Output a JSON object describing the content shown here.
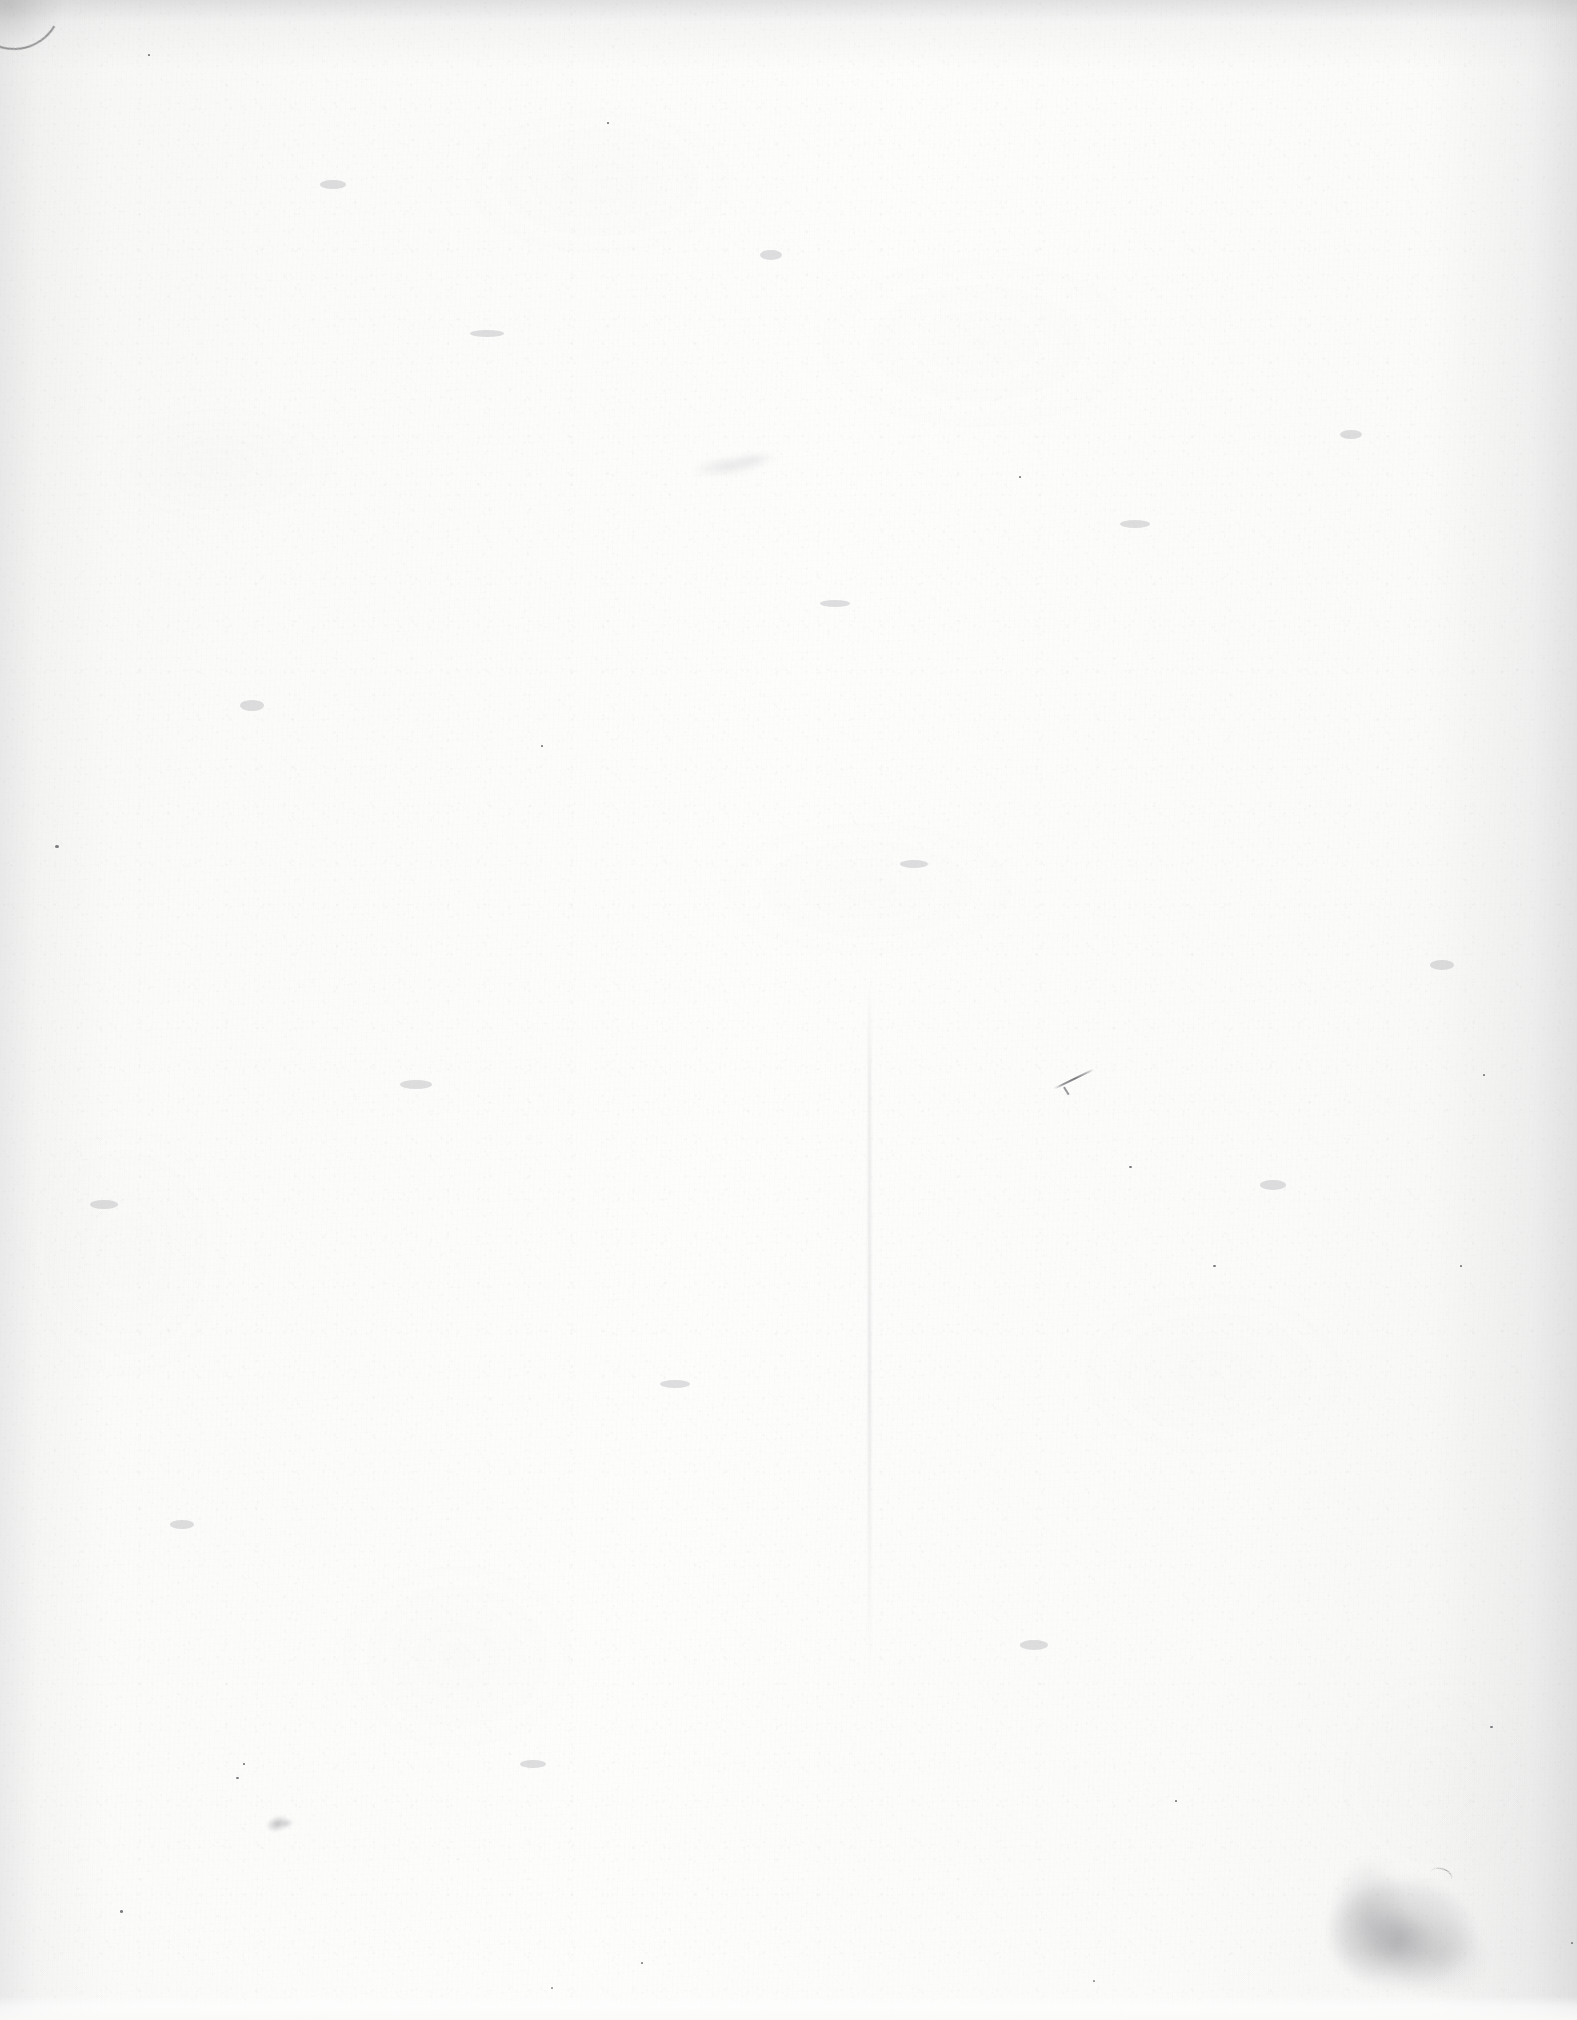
{
  "page": {
    "kind": "scanned-blank-page",
    "width": 1577,
    "height": 2020,
    "text_content": "",
    "orientation": "portrait",
    "background_color": "#fbfbfa",
    "paper_tone": "#f7f7f6",
    "ink_color": "#555559"
  },
  "artifacts": {
    "corner_fold": {
      "name": "torn-corner",
      "position": "top-left",
      "x": 0,
      "y": 0,
      "width": 110,
      "height": 110,
      "color": "#5c5c60"
    },
    "scan_streak": {
      "name": "vertical-scan-streak",
      "x": 868,
      "y": 980,
      "width": 3,
      "height": 700,
      "color": "#a0a0a5"
    },
    "stain": {
      "name": "corner-stain",
      "position": "bottom-right",
      "x": 1300,
      "y": 1855,
      "width": 230,
      "height": 165,
      "color": "#707076"
    },
    "smudge": {
      "name": "graphite-smudge",
      "position": "lower-left",
      "x": 258,
      "y": 1805,
      "width": 46,
      "height": 34,
      "color": "#6e6e74"
    },
    "pen_mark": {
      "name": "diagonal-pen-stroke",
      "x": 1052,
      "y": 1078,
      "length": 44,
      "angle": -26,
      "color": "#585860"
    },
    "show_through": {
      "name": "faint-show-through",
      "x": 676,
      "y": 444,
      "width": 120,
      "height": 42,
      "color": "#96969c"
    },
    "specks": [
      {
        "x": 55,
        "y": 845,
        "size": 4.0
      },
      {
        "x": 120,
        "y": 1910,
        "size": 3.2
      },
      {
        "x": 1213,
        "y": 1265,
        "size": 2.6
      },
      {
        "x": 1460,
        "y": 1265,
        "size": 2.4
      },
      {
        "x": 1490,
        "y": 1726,
        "size": 2.5
      },
      {
        "x": 1483,
        "y": 1074,
        "size": 2.3
      },
      {
        "x": 1129,
        "y": 1166,
        "size": 2.6
      },
      {
        "x": 541,
        "y": 745,
        "size": 2.2
      },
      {
        "x": 243,
        "y": 1763,
        "size": 2.4
      },
      {
        "x": 236,
        "y": 1777,
        "size": 2.6
      },
      {
        "x": 641,
        "y": 1962,
        "size": 2.2
      },
      {
        "x": 551,
        "y": 1987,
        "size": 2.0
      },
      {
        "x": 1093,
        "y": 1980,
        "size": 2.3
      },
      {
        "x": 1175,
        "y": 1800,
        "size": 2.0
      },
      {
        "x": 607,
        "y": 122,
        "size": 2.2
      },
      {
        "x": 148,
        "y": 54,
        "size": 2.0
      },
      {
        "x": 1019,
        "y": 476,
        "size": 2.1
      },
      {
        "x": 1571,
        "y": 1942,
        "size": 2.4
      }
    ],
    "flecks": [
      {
        "x": 320,
        "y": 180,
        "w": 26,
        "h": 9
      },
      {
        "x": 470,
        "y": 330,
        "w": 34,
        "h": 7
      },
      {
        "x": 760,
        "y": 250,
        "w": 22,
        "h": 10
      },
      {
        "x": 1120,
        "y": 520,
        "w": 30,
        "h": 8
      },
      {
        "x": 240,
        "y": 700,
        "w": 24,
        "h": 11
      },
      {
        "x": 900,
        "y": 860,
        "w": 28,
        "h": 8
      },
      {
        "x": 400,
        "y": 1080,
        "w": 32,
        "h": 9
      },
      {
        "x": 1260,
        "y": 1180,
        "w": 26,
        "h": 10
      },
      {
        "x": 660,
        "y": 1380,
        "w": 30,
        "h": 8
      },
      {
        "x": 170,
        "y": 1520,
        "w": 24,
        "h": 9
      },
      {
        "x": 1020,
        "y": 1640,
        "w": 28,
        "h": 10
      },
      {
        "x": 520,
        "y": 1760,
        "w": 26,
        "h": 8
      },
      {
        "x": 1340,
        "y": 430,
        "w": 22,
        "h": 9
      },
      {
        "x": 820,
        "y": 600,
        "w": 30,
        "h": 7
      },
      {
        "x": 1430,
        "y": 960,
        "w": 24,
        "h": 10
      },
      {
        "x": 90,
        "y": 1200,
        "w": 28,
        "h": 9
      }
    ]
  }
}
